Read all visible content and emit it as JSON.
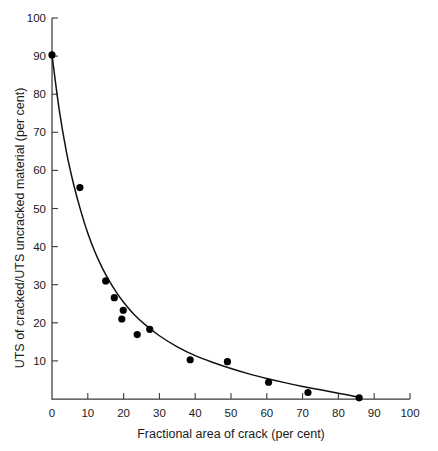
{
  "chart_data": {
    "type": "scatter",
    "title": "",
    "xlabel": "Fractional area of crack (per cent)",
    "ylabel": "UTS of cracked/UTS uncracked material (per cent)",
    "xlim": [
      0,
      100
    ],
    "ylim": [
      0,
      100
    ],
    "xticks": [
      0,
      10,
      20,
      30,
      40,
      50,
      60,
      70,
      80,
      90,
      100
    ],
    "yticks": [
      10,
      20,
      30,
      40,
      50,
      60,
      70,
      80,
      90,
      100
    ],
    "xtick_labels": [
      "0",
      "10",
      "20",
      "30",
      "40",
      "50",
      "60",
      "70",
      "80",
      "90",
      "100"
    ],
    "ytick_labels": [
      "10",
      "20",
      "30",
      "40",
      "50",
      "60",
      "70",
      "80",
      "90",
      "100"
    ],
    "grid": false,
    "legend": null,
    "series": [
      {
        "name": "Measured data",
        "marker": "filled-circle",
        "color": "#000000",
        "points": [
          {
            "x": 0.0,
            "y": 90.3
          },
          {
            "x": 7.8,
            "y": 55.5
          },
          {
            "x": 15.0,
            "y": 31.0
          },
          {
            "x": 17.4,
            "y": 26.6
          },
          {
            "x": 19.9,
            "y": 23.3
          },
          {
            "x": 19.5,
            "y": 21.0
          },
          {
            "x": 23.8,
            "y": 16.9
          },
          {
            "x": 27.3,
            "y": 18.3
          },
          {
            "x": 38.6,
            "y": 10.3
          },
          {
            "x": 49.0,
            "y": 9.8
          },
          {
            "x": 60.5,
            "y": 4.4
          },
          {
            "x": 71.5,
            "y": 1.7
          },
          {
            "x": 85.8,
            "y": 0.3
          }
        ]
      },
      {
        "name": "Fitted curve",
        "marker": "none",
        "color": "#111111",
        "points": [
          {
            "x": 0.0,
            "y": 90.3
          },
          {
            "x": 2.0,
            "y": 76.0
          },
          {
            "x": 4.0,
            "y": 65.0
          },
          {
            "x": 6.0,
            "y": 56.5
          },
          {
            "x": 8.0,
            "y": 49.5
          },
          {
            "x": 10.0,
            "y": 43.5
          },
          {
            "x": 12.0,
            "y": 38.6
          },
          {
            "x": 14.0,
            "y": 34.5
          },
          {
            "x": 16.0,
            "y": 31.0
          },
          {
            "x": 18.0,
            "y": 28.0
          },
          {
            "x": 20.0,
            "y": 25.4
          },
          {
            "x": 23.0,
            "y": 22.1
          },
          {
            "x": 26.0,
            "y": 19.5
          },
          {
            "x": 30.0,
            "y": 16.6
          },
          {
            "x": 35.0,
            "y": 13.7
          },
          {
            "x": 40.0,
            "y": 11.4
          },
          {
            "x": 45.0,
            "y": 9.6
          },
          {
            "x": 50.0,
            "y": 8.0
          },
          {
            "x": 55.0,
            "y": 6.6
          },
          {
            "x": 60.0,
            "y": 5.4
          },
          {
            "x": 65.0,
            "y": 4.3
          },
          {
            "x": 70.0,
            "y": 3.3
          },
          {
            "x": 75.0,
            "y": 2.4
          },
          {
            "x": 80.0,
            "y": 1.5
          },
          {
            "x": 83.0,
            "y": 1.0
          },
          {
            "x": 86.0,
            "y": 0.4
          }
        ]
      }
    ]
  }
}
